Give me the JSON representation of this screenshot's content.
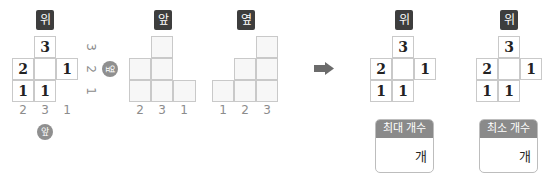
{
  "views": {
    "top": {
      "label": "위",
      "cells": [
        {
          "row": 0,
          "col": 1,
          "value": "3"
        },
        {
          "row": 1,
          "col": 0,
          "value": "2"
        },
        {
          "row": 1,
          "col": 1,
          "value": ""
        },
        {
          "row": 1,
          "col": 2,
          "value": "1"
        },
        {
          "row": 2,
          "col": 0,
          "value": "1"
        },
        {
          "row": 2,
          "col": 1,
          "value": "1"
        }
      ],
      "bottom_labels": [
        "2",
        "3",
        "1"
      ],
      "side_labels": [
        "3",
        "2",
        "1"
      ],
      "front_badge": "앞",
      "side_badge": "옆"
    },
    "front": {
      "label": "앞",
      "column_heights": [
        2,
        3,
        1
      ],
      "bottom_labels": [
        "2",
        "3",
        "1"
      ]
    },
    "side": {
      "label": "옆",
      "column_heights": [
        1,
        2,
        3
      ],
      "bottom_labels": [
        "1",
        "2",
        "3"
      ]
    }
  },
  "arrow": "right-arrow",
  "answers": [
    {
      "label": "위",
      "cells": [
        {
          "row": 0,
          "col": 1,
          "value": "3"
        },
        {
          "row": 1,
          "col": 0,
          "value": "2"
        },
        {
          "row": 1,
          "col": 1,
          "value": ""
        },
        {
          "row": 1,
          "col": 2,
          "value": "1"
        },
        {
          "row": 2,
          "col": 0,
          "value": "1"
        },
        {
          "row": 2,
          "col": 1,
          "value": "1"
        }
      ],
      "box_title": "최대 개수",
      "box_value": "",
      "box_unit": "개"
    },
    {
      "label": "위",
      "cells": [
        {
          "row": 0,
          "col": 1,
          "value": "3"
        },
        {
          "row": 1,
          "col": 0,
          "value": "2"
        },
        {
          "row": 1,
          "col": 1,
          "value": ""
        },
        {
          "row": 1,
          "col": 2,
          "value": "1"
        },
        {
          "row": 2,
          "col": 0,
          "value": "1"
        },
        {
          "row": 2,
          "col": 1,
          "value": "1"
        }
      ],
      "box_title": "최소 개수",
      "box_value": "",
      "box_unit": "개"
    }
  ]
}
